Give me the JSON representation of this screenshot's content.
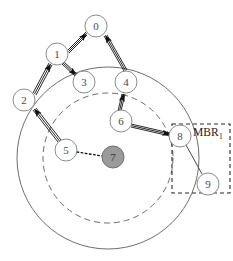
{
  "diagram": {
    "type": "graph-over-range-circles",
    "background": "#ffffff",
    "colors": {
      "node_stroke": "#8c8c8c",
      "node_fill": "#ffffff",
      "node_text": "#4a4a4a",
      "query_fill": "#9a9a9a",
      "query_stroke": "#6f6f6f",
      "edge": "#1a1a1a",
      "circle_stroke": "#6e6e6e",
      "mbr_stroke": "#2a2a2a",
      "label_text": "#1a1a1a"
    },
    "nodes": [
      {
        "id": "node-0",
        "label": "0",
        "cx": 96,
        "cy": 26,
        "r": 11,
        "filled": false
      },
      {
        "id": "node-1",
        "label": "1",
        "cx": 57,
        "cy": 54,
        "r": 11,
        "filled": false
      },
      {
        "id": "node-2",
        "label": "2",
        "cx": 24,
        "cy": 100,
        "r": 11,
        "filled": false
      },
      {
        "id": "node-3",
        "label": "3",
        "cx": 84,
        "cy": 82,
        "r": 11,
        "filled": false
      },
      {
        "id": "node-4",
        "label": "4",
        "cx": 126,
        "cy": 82,
        "r": 11,
        "filled": false
      },
      {
        "id": "node-5",
        "label": "5",
        "cx": 66,
        "cy": 150,
        "r": 11,
        "filled": false
      },
      {
        "id": "node-6",
        "label": "6",
        "cx": 121,
        "cy": 121,
        "r": 11,
        "filled": false
      },
      {
        "id": "node-7",
        "label": "7",
        "cx": 113,
        "cy": 157,
        "r": 11,
        "filled": true
      },
      {
        "id": "node-8",
        "label": "8",
        "cx": 180,
        "cy": 136,
        "r": 11,
        "filled": false
      },
      {
        "id": "node-9",
        "label": "9",
        "cx": 208,
        "cy": 184,
        "r": 11,
        "filled": false
      }
    ],
    "edges": [
      {
        "id": "edge-1-0",
        "from": "node-1",
        "to": "node-0",
        "arrow": "to",
        "style": "double"
      },
      {
        "id": "edge-1-3",
        "from": "node-1",
        "to": "node-3",
        "arrow": "to",
        "style": "double"
      },
      {
        "id": "edge-2-1",
        "from": "node-2",
        "to": "node-1",
        "arrow": "to",
        "style": "double"
      },
      {
        "id": "edge-4-0",
        "from": "node-4",
        "to": "node-0",
        "arrow": "to",
        "style": "double"
      },
      {
        "id": "edge-5-2",
        "from": "node-5",
        "to": "node-2",
        "arrow": "to",
        "style": "double"
      },
      {
        "id": "edge-6-4",
        "from": "node-6",
        "to": "node-4",
        "arrow": "to",
        "style": "double"
      },
      {
        "id": "edge-6-8",
        "from": "node-6",
        "to": "node-8",
        "arrow": "to",
        "style": "double"
      },
      {
        "id": "edge-8-9",
        "from": "node-8",
        "to": "node-9",
        "arrow": "none",
        "style": "single"
      },
      {
        "id": "edge-5-7",
        "from": "node-5",
        "to": "node-7",
        "arrow": "none",
        "style": "dotted"
      }
    ],
    "range_circles": [
      {
        "id": "outer-range-circle",
        "cx": 108,
        "cy": 158,
        "r": 91,
        "dash": "solid"
      },
      {
        "id": "inner-range-circle",
        "cx": 108,
        "cy": 158,
        "r": 65,
        "dash": "dashed"
      }
    ],
    "mbr_box": {
      "id": "mbr-box",
      "x": 172,
      "y": 124,
      "width": 58,
      "height": 69,
      "label": "MBR",
      "subscript": "1"
    }
  }
}
